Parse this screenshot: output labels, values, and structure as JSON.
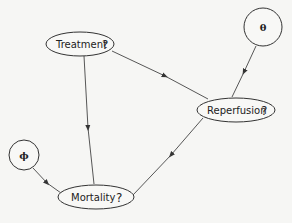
{
  "diagram": {
    "type": "influence-diagram",
    "nodes": [
      {
        "id": "treatment",
        "label": "Treatment",
        "suffix": "?",
        "shape": "ellipse"
      },
      {
        "id": "reperfusion",
        "label": "Reperfusion",
        "suffix": "?",
        "shape": "ellipse"
      },
      {
        "id": "mortality",
        "label": "Mortality",
        "suffix": "?",
        "shape": "ellipse"
      },
      {
        "id": "theta",
        "label": "θ",
        "shape": "circle"
      },
      {
        "id": "phi",
        "label": "ϕ",
        "shape": "circle"
      }
    ],
    "edges": [
      {
        "from": "treatment",
        "to": "reperfusion"
      },
      {
        "from": "theta",
        "to": "reperfusion"
      },
      {
        "from": "treatment",
        "to": "mortality"
      },
      {
        "from": "reperfusion",
        "to": "mortality"
      },
      {
        "from": "phi",
        "to": "mortality"
      }
    ]
  }
}
